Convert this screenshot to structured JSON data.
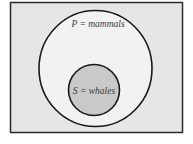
{
  "diagram": {
    "type": "euler-diagram",
    "colors": {
      "frame_fill": "#e6e6e6",
      "frame_stroke": "#2a2a2a",
      "outer_fill": "#f2f2f2",
      "outer_stroke": "#1a1a1a",
      "inner_fill": "#c9c9c9",
      "inner_stroke": "#1a1a1a",
      "text": "#3a3a3a"
    },
    "outer_set": {
      "symbol": "P",
      "label": "P = mammals"
    },
    "inner_set": {
      "symbol": "S",
      "label": "S = whales"
    }
  }
}
